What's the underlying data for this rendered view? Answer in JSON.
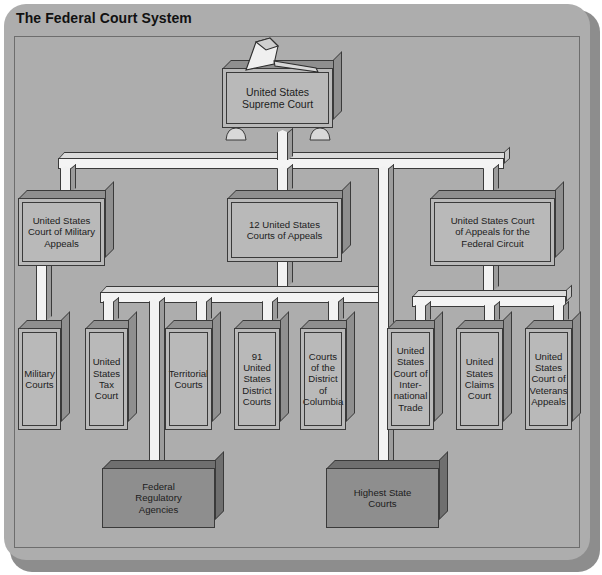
{
  "diagram": {
    "title": "The Federal Court System",
    "colors": {
      "panel": "#adadad",
      "box_face": "#b9b9b9",
      "box_shade": "#8f8f8f",
      "box_dark_face": "#8e8e8e",
      "connector": "#f2f2f2",
      "outline": "#3a3a3a",
      "text": "#1c1c1c"
    },
    "icon": "gavel-icon",
    "tiers": {
      "tier1": [
        {
          "id": "supreme-court",
          "label": "United States\nSupreme Court"
        }
      ],
      "tier2": [
        {
          "id": "court-military-appeals",
          "label": "United States\nCourt of Military\nAppeals"
        },
        {
          "id": "courts-of-appeals",
          "label": "12 United States\nCourts of Appeals"
        },
        {
          "id": "court-appeals-federal-circuit",
          "label": "United States Court\nof Appeals for the\nFederal Circuit"
        }
      ],
      "tier3": [
        {
          "id": "military-courts",
          "label": "Military\nCourts"
        },
        {
          "id": "us-tax-court",
          "label": "United\nStates\nTax Court"
        },
        {
          "id": "territorial-courts",
          "label": "Territorial\nCourts"
        },
        {
          "id": "us-district-courts",
          "label": "91\nUnited\nStates\nDistrict\nCourts"
        },
        {
          "id": "courts-district-columbia",
          "label": "Courts\nof the\nDistrict\nof\nColumbia"
        },
        {
          "id": "court-international-trade",
          "label": "United\nStates\nCourt of\nInter-\nnational\nTrade"
        },
        {
          "id": "us-claims-court",
          "label": "United\nStates\nClaims\nCourt"
        },
        {
          "id": "court-veterans-appeals",
          "label": "United\nStates\nCourt of\nVeterans\nAppeals"
        }
      ],
      "tier4": [
        {
          "id": "federal-regulatory-agencies",
          "label": "Federal\nRegulatory\nAgencies"
        },
        {
          "id": "highest-state-courts",
          "label": "Highest State\nCourts"
        }
      ]
    }
  }
}
